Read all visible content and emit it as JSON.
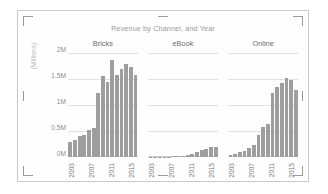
{
  "chart_object": {
    "selection_handles": [
      "top-left",
      "top-middle",
      "top-right",
      "left-middle",
      "right-middle",
      "bottom-left",
      "bottom-middle",
      "bottom-right"
    ]
  },
  "chart_data": {
    "type": "bar",
    "title": "Revenue by Channel, and Year",
    "xlabel": "",
    "ylabel": "(Millions)",
    "ylim": [
      0,
      2000000
    ],
    "ytick_labels": [
      "0M",
      "0.5M",
      "1M",
      "1.5M",
      "2M"
    ],
    "ytick_values": [
      0,
      500000,
      1000000,
      1500000,
      2000000
    ],
    "grid": true,
    "legend": "none",
    "layout": "small-multiples (facet by Channel)",
    "facet_label": "Channel",
    "x": [
      2003,
      2004,
      2005,
      2006,
      2007,
      2008,
      2009,
      2010,
      2011,
      2012,
      2013,
      2014,
      2015
    ],
    "xtick_labels": [
      "2003",
      "2007",
      "2011",
      "2015"
    ],
    "xtick_values": [
      2003,
      2007,
      2011,
      2015
    ],
    "panels": [
      {
        "name": "Bricks",
        "values": [
          280000,
          330000,
          400000,
          430000,
          520000,
          560000,
          1230000,
          1560000,
          1450000,
          1870000,
          1580000,
          1700000,
          1790000,
          1740000,
          1580000
        ]
      },
      {
        "name": "eBook",
        "values": [
          2000,
          3000,
          4000,
          5000,
          8000,
          12000,
          18000,
          26000,
          38000,
          55000,
          95000,
          130000,
          160000,
          185000,
          195000
        ]
      },
      {
        "name": "Online",
        "values": [
          40000,
          60000,
          90000,
          120000,
          180000,
          230000,
          420000,
          580000,
          630000,
          1240000,
          1350000,
          1430000,
          1510000,
          1480000,
          1280000
        ]
      }
    ],
    "panel_series": {
      "Bricks": {
        "2003": 280000,
        "2004": 330000,
        "2005": 400000,
        "2006": 430000,
        "2007": 520000,
        "2008": 560000,
        "2009": 1230000,
        "2010": 1560000,
        "2011": 1450000,
        "2012": 1870000,
        "2013": 1580000,
        "2014": 1790000,
        "2015": 1580000
      },
      "eBook": {
        "2003": 2000,
        "2004": 3000,
        "2005": 5000,
        "2006": 8000,
        "2007": 12000,
        "2008": 18000,
        "2009": 26000,
        "2010": 38000,
        "2011": 55000,
        "2012": 95000,
        "2013": 130000,
        "2014": 185000,
        "2015": 195000
      },
      "Online": {
        "2003": 40000,
        "2004": 60000,
        "2005": 90000,
        "2006": 120000,
        "2007": 180000,
        "2008": 230000,
        "2009": 420000,
        "2010": 580000,
        "2011": 630000,
        "2012": 1240000,
        "2013": 1430000,
        "2014": 1510000,
        "2015": 1280000
      }
    },
    "bar_color": "#9e9e9e",
    "gridline_color": "#e2e2e2",
    "title_color": "#9b9b9b",
    "axis_label_color": "#8c8c8c"
  }
}
